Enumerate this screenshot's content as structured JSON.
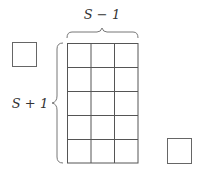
{
  "diagram": {
    "top_label": "S − 1",
    "side_label": "S + 1",
    "grid": {
      "rows": 5,
      "cols": 3
    },
    "extra_squares": 2,
    "colors": {
      "stroke": "#555555",
      "background": "#ffffff"
    }
  }
}
